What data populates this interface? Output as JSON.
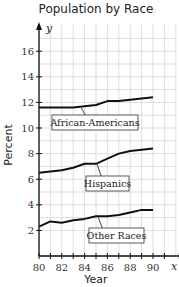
{
  "chart_data": {
    "type": "line",
    "title": "Population by Race",
    "xlabel": "Year",
    "ylabel": "Percent",
    "x_axis_var": "x",
    "y_axis_var": "y",
    "xlim": [
      80,
      92
    ],
    "ylim": [
      0,
      17.5
    ],
    "grid": true,
    "x": [
      80,
      81,
      82,
      83,
      84,
      85,
      86,
      87,
      88,
      89,
      90
    ],
    "x_ticks": [
      "80",
      "82",
      "84",
      "86",
      "88",
      "90"
    ],
    "y_ticks": [
      "2",
      "4",
      "6",
      "8",
      "10",
      "12",
      "14",
      "16"
    ],
    "series": [
      {
        "name": "African-Americans",
        "values": [
          11.6,
          11.6,
          11.6,
          11.6,
          11.7,
          11.8,
          12.1,
          12.1,
          12.2,
          12.3,
          12.4
        ]
      },
      {
        "name": "Hispanics",
        "values": [
          6.5,
          6.6,
          6.7,
          6.9,
          7.2,
          7.2,
          7.6,
          8.0,
          8.2,
          8.3,
          8.4
        ]
      },
      {
        "name": "Other Races",
        "values": [
          2.3,
          2.7,
          2.6,
          2.8,
          2.9,
          3.1,
          3.1,
          3.2,
          3.4,
          3.6,
          3.6
        ]
      }
    ],
    "annotations": [
      {
        "text": "African-Americans",
        "series": "African-Americans",
        "placement": "below-line"
      },
      {
        "text": "Hispanics",
        "series": "Hispanics",
        "placement": "below-line"
      },
      {
        "text": "Other Races",
        "series": "Other Races",
        "placement": "below-line"
      }
    ]
  }
}
